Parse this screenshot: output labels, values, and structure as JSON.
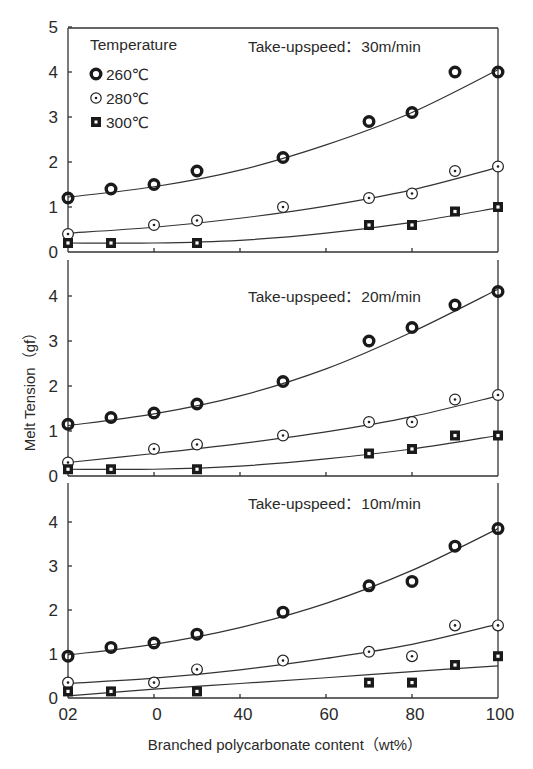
{
  "chart_data": {
    "type": "scatter",
    "layout": "3 vertically stacked panels sharing x-axis, points with fitted smooth curves",
    "xlabel": "Branched polycarbonate content（wt%）",
    "ylabel": "Melt Tension（gf）",
    "x_tick_labels": [
      "02",
      "0",
      "40",
      "60",
      "80",
      "100"
    ],
    "x_tick_values": [
      0,
      20,
      40,
      60,
      80,
      100
    ],
    "xlim": [
      0,
      100
    ],
    "grid": false,
    "legend": {
      "title": "Temperature",
      "position": "top-left of top panel",
      "entries": [
        {
          "label": "260℃",
          "marker": "thick-ring"
        },
        {
          "label": "280℃",
          "marker": "dotted-circle"
        },
        {
          "label": "300℃",
          "marker": "filled-square-with-dot"
        }
      ]
    },
    "panels": [
      {
        "title": "Take-upspeed：30m/min",
        "y_tick_labels": [
          "0",
          "1",
          "2",
          "3",
          "4",
          "5"
        ],
        "ylim": [
          0,
          5
        ],
        "series": [
          {
            "name": "260℃",
            "x": [
              0,
              10,
              20,
              30,
              50,
              70,
              80,
              90,
              100
            ],
            "y": [
              1.2,
              1.4,
              1.5,
              1.8,
              2.1,
              2.9,
              3.1,
              4.0,
              4.0
            ]
          },
          {
            "name": "280℃",
            "x": [
              0,
              20,
              30,
              50,
              70,
              80,
              90,
              100
            ],
            "y": [
              0.4,
              0.6,
              0.7,
              1.0,
              1.2,
              1.3,
              1.8,
              1.9
            ]
          },
          {
            "name": "300℃",
            "x": [
              0,
              10,
              30,
              70,
              80,
              90,
              100
            ],
            "y": [
              0.2,
              0.2,
              0.2,
              0.6,
              0.6,
              0.9,
              1.0
            ]
          }
        ],
        "fits": [
          {
            "name": "260℃",
            "y_at": [
              [
                0,
                1.22
              ],
              [
                20,
                1.45
              ],
              [
                40,
                1.82
              ],
              [
                60,
                2.38
              ],
              [
                80,
                3.1
              ],
              [
                100,
                4.05
              ]
            ]
          },
          {
            "name": "280℃",
            "y_at": [
              [
                0,
                0.42
              ],
              [
                20,
                0.55
              ],
              [
                40,
                0.75
              ],
              [
                60,
                1.02
              ],
              [
                80,
                1.38
              ],
              [
                100,
                1.88
              ]
            ]
          },
          {
            "name": "300℃",
            "y_at": [
              [
                0,
                0.2
              ],
              [
                20,
                0.2
              ],
              [
                40,
                0.26
              ],
              [
                60,
                0.42
              ],
              [
                80,
                0.66
              ],
              [
                100,
                0.98
              ]
            ]
          }
        ]
      },
      {
        "title": "Take-upspeed：20m/min",
        "y_tick_labels": [
          "0",
          "1",
          "2",
          "3",
          "4"
        ],
        "ylim": [
          0,
          5
        ],
        "series": [
          {
            "name": "260℃",
            "x": [
              0,
              10,
              20,
              30,
              50,
              70,
              80,
              90,
              100
            ],
            "y": [
              1.15,
              1.3,
              1.4,
              1.6,
              2.1,
              3.0,
              3.3,
              3.8,
              4.1
            ]
          },
          {
            "name": "280℃",
            "x": [
              0,
              20,
              30,
              50,
              70,
              80,
              90,
              100
            ],
            "y": [
              0.3,
              0.6,
              0.7,
              0.9,
              1.2,
              1.2,
              1.7,
              1.8
            ]
          },
          {
            "name": "300℃",
            "x": [
              0,
              10,
              30,
              70,
              80,
              90,
              100
            ],
            "y": [
              0.15,
              0.15,
              0.15,
              0.5,
              0.6,
              0.9,
              0.9
            ]
          }
        ],
        "fits": [
          {
            "name": "260℃",
            "y_at": [
              [
                0,
                1.12
              ],
              [
                20,
                1.38
              ],
              [
                40,
                1.78
              ],
              [
                60,
                2.38
              ],
              [
                80,
                3.2
              ],
              [
                100,
                4.15
              ]
            ]
          },
          {
            "name": "280℃",
            "y_at": [
              [
                0,
                0.3
              ],
              [
                20,
                0.5
              ],
              [
                40,
                0.72
              ],
              [
                60,
                0.98
              ],
              [
                80,
                1.32
              ],
              [
                100,
                1.78
              ]
            ]
          },
          {
            "name": "300℃",
            "y_at": [
              [
                0,
                0.15
              ],
              [
                20,
                0.15
              ],
              [
                40,
                0.22
              ],
              [
                60,
                0.38
              ],
              [
                80,
                0.6
              ],
              [
                100,
                0.9
              ]
            ]
          }
        ]
      },
      {
        "title": "Take-upspeed：10m/min",
        "y_tick_labels": [
          "0",
          "1",
          "2",
          "3",
          "4"
        ],
        "ylim": [
          0,
          5
        ],
        "series": [
          {
            "name": "260℃",
            "x": [
              0,
              10,
              20,
              30,
              50,
              70,
              80,
              90,
              100
            ],
            "y": [
              0.95,
              1.15,
              1.25,
              1.45,
              1.95,
              2.55,
              2.65,
              3.45,
              3.85
            ]
          },
          {
            "name": "280℃",
            "x": [
              0,
              20,
              30,
              50,
              70,
              80,
              90,
              100
            ],
            "y": [
              0.35,
              0.35,
              0.65,
              0.85,
              1.05,
              0.95,
              1.65,
              1.65
            ]
          },
          {
            "name": "300℃",
            "x": [
              0,
              10,
              30,
              70,
              80,
              90,
              100
            ],
            "y": [
              0.15,
              0.15,
              0.15,
              0.35,
              0.35,
              0.75,
              0.95
            ]
          }
        ],
        "fits": [
          {
            "name": "260℃",
            "y_at": [
              [
                0,
                0.98
              ],
              [
                20,
                1.22
              ],
              [
                40,
                1.6
              ],
              [
                60,
                2.15
              ],
              [
                80,
                2.9
              ],
              [
                100,
                3.85
              ]
            ]
          },
          {
            "name": "280℃",
            "y_at": [
              [
                0,
                0.33
              ],
              [
                20,
                0.45
              ],
              [
                40,
                0.64
              ],
              [
                60,
                0.9
              ],
              [
                80,
                1.22
              ],
              [
                100,
                1.68
              ]
            ]
          },
          {
            "name": "300℃",
            "y_at": [
              [
                0,
                0.05
              ],
              [
                20,
                0.2
              ],
              [
                40,
                0.33
              ],
              [
                60,
                0.46
              ],
              [
                80,
                0.6
              ],
              [
                100,
                0.73
              ]
            ]
          }
        ]
      }
    ]
  },
  "layout": {
    "x_px": [
      68,
      498
    ],
    "panels_px": [
      {
        "top": 28,
        "zero": 252,
        "unit": 45,
        "title_x": 248,
        "title_y": 52,
        "draw_top": true
      },
      {
        "top": 260,
        "zero": 476,
        "unit": 45,
        "title_x": 248,
        "title_y": 302,
        "draw_top": false
      },
      {
        "top": 483,
        "zero": 698,
        "unit": 44,
        "title_x": 248,
        "title_y": 509,
        "draw_top": false
      }
    ],
    "colors": {
      "ink": "#2a2a2a",
      "line": "#333333",
      "background": "#ffffff"
    }
  }
}
